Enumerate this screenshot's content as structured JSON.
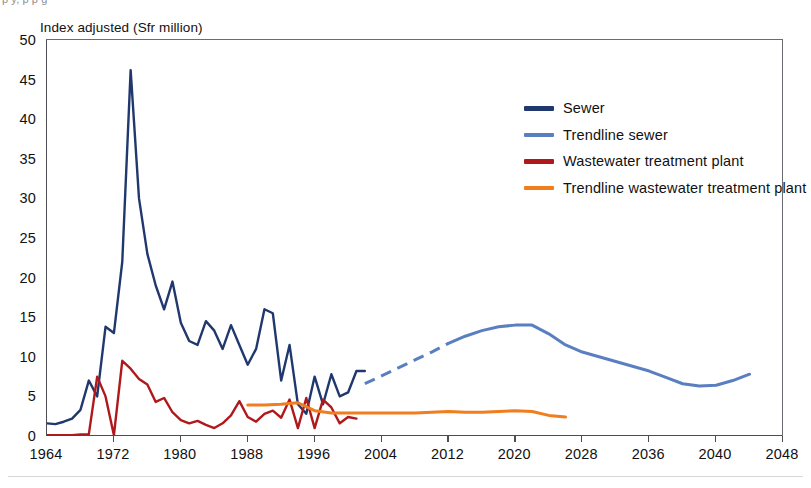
{
  "page": {
    "cutoff_header": "p y, p p                                                                      g",
    "footer_rule": ""
  },
  "chart_data": {
    "type": "line",
    "title": "",
    "ylabel": "Index adjusted (Sfr million)",
    "xlabel": "",
    "ylim": [
      0,
      50
    ],
    "xlim": [
      1964,
      2048
    ],
    "yticks": [
      0,
      5,
      10,
      15,
      20,
      25,
      30,
      35,
      40,
      45,
      50
    ],
    "ytick_labels": [
      "0",
      "5",
      "10",
      "15",
      "20",
      "25",
      "30",
      "35",
      "40",
      "45",
      "50"
    ],
    "xticks": [
      1964,
      1972,
      1980,
      1988,
      1996,
      2004,
      2012,
      2020,
      2028,
      2036,
      2040,
      2048
    ],
    "xtick_labels": [
      "1964",
      "1972",
      "1980",
      "1988",
      "1996",
      "2004",
      "2012",
      "2020",
      "2028",
      "2036",
      "2040",
      "2048"
    ],
    "grid": false,
    "legend_position": "upper-right",
    "colors": {
      "sewer": "#21386f",
      "trendline_sewer": "#5a7fc0",
      "wastewater": "#b0191c",
      "trendline_wastewater": "#f07d1e"
    },
    "series": [
      {
        "name": "Sewer",
        "color": "#21386f",
        "style": "solid",
        "x": [
          1964,
          1965,
          1966,
          1967,
          1968,
          1969,
          1970,
          1971,
          1972,
          1973,
          1974,
          1975,
          1976,
          1977,
          1978,
          1979,
          1980,
          1981,
          1982,
          1983,
          1984,
          1985,
          1986,
          1987,
          1988,
          1989,
          1990,
          1991,
          1992,
          1993,
          1994,
          1995,
          1996,
          1997,
          1998,
          1999,
          2000,
          2001,
          2002
        ],
        "values": [
          1.6,
          1.5,
          1.8,
          2.2,
          3.3,
          7.0,
          5.0,
          13.8,
          13.0,
          22.0,
          46.2,
          30.0,
          23.0,
          19.0,
          16.0,
          19.5,
          14.3,
          12.0,
          11.5,
          14.5,
          13.3,
          11.0,
          14.0,
          11.5,
          9.0,
          11.0,
          16.0,
          15.5,
          7.0,
          11.5,
          4.0,
          2.8,
          7.5,
          4.0,
          7.8,
          5.0,
          5.5,
          8.2,
          8.2
        ]
      },
      {
        "name": "Trendline sewer",
        "color": "#5a7fc0",
        "style": "dashed-then-solid",
        "x": [
          2002,
          2004,
          2006,
          2008,
          2010,
          2012,
          2014,
          2016,
          2018,
          2020,
          2022,
          2024,
          2026,
          2028,
          2030,
          2032,
          2034,
          2036,
          2038,
          2040,
          2042,
          2044,
          2046,
          2048
        ],
        "values": [
          6.6,
          7.6,
          8.6,
          9.6,
          10.6,
          11.7,
          12.6,
          13.3,
          13.8,
          14.0,
          14.0,
          12.9,
          11.5,
          10.6,
          10.0,
          9.4,
          8.8,
          8.2,
          7.4,
          6.6,
          6.3,
          6.4,
          7.0,
          7.8
        ]
      },
      {
        "name": "Wastewater treatment plant",
        "color": "#b0191c",
        "style": "solid",
        "x": [
          1964,
          1965,
          1966,
          1967,
          1968,
          1969,
          1970,
          1971,
          1972,
          1973,
          1974,
          1975,
          1976,
          1977,
          1978,
          1979,
          1980,
          1981,
          1982,
          1983,
          1984,
          1985,
          1986,
          1987,
          1988,
          1989,
          1990,
          1991,
          1992,
          1993,
          1994,
          1995,
          1996,
          1997,
          1998,
          1999,
          2000,
          2001
        ],
        "values": [
          0.1,
          0.1,
          0.1,
          0.1,
          0.2,
          0.2,
          7.5,
          5.0,
          0.1,
          9.5,
          8.5,
          7.2,
          6.5,
          4.3,
          4.8,
          3.0,
          2.0,
          1.6,
          1.9,
          1.4,
          1.0,
          1.6,
          2.6,
          4.4,
          2.4,
          1.8,
          2.8,
          3.2,
          2.3,
          4.6,
          1.0,
          4.8,
          1.0,
          4.6,
          3.6,
          1.6,
          2.4,
          2.2
        ]
      },
      {
        "name": "Trendline wastewater treatment plant",
        "color": "#f07d1e",
        "style": "solid",
        "x": [
          1988,
          1990,
          1992,
          1994,
          1996,
          1998,
          2000,
          2002,
          2004,
          2006,
          2008,
          2010,
          2012,
          2014,
          2016,
          2018,
          2020,
          2022,
          2024,
          2026
        ],
        "values": [
          3.9,
          3.9,
          4.0,
          4.2,
          3.2,
          2.9,
          2.9,
          2.9,
          2.9,
          2.9,
          2.9,
          3.0,
          3.1,
          3.0,
          3.0,
          3.1,
          3.2,
          3.1,
          2.6,
          2.4
        ]
      }
    ]
  },
  "legend": {
    "items": [
      {
        "label": "Sewer",
        "color": "#21386f"
      },
      {
        "label": "Trendline sewer",
        "color": "#5a7fc0"
      },
      {
        "label": "Wastewater treatment plant",
        "color": "#b0191c"
      },
      {
        "label": "Trendline wastewater treatment plant",
        "color": "#f07d1e"
      }
    ]
  }
}
